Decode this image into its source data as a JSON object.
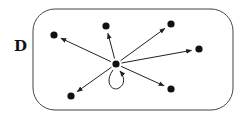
{
  "diagram": {
    "label": "D",
    "region": {
      "x": 33,
      "y": 9,
      "width": 200,
      "height": 101,
      "rx": 22,
      "stroke": "#444444"
    },
    "center_node": {
      "id": "c",
      "x": 116,
      "y": 64
    },
    "nodes": [
      {
        "id": "n1",
        "x": 54,
        "y": 35
      },
      {
        "id": "n2",
        "x": 106,
        "y": 26
      },
      {
        "id": "n3",
        "x": 171,
        "y": 24
      },
      {
        "id": "n4",
        "x": 199,
        "y": 49
      },
      {
        "id": "n5",
        "x": 171,
        "y": 89
      },
      {
        "id": "n6",
        "x": 71,
        "y": 96
      }
    ],
    "edges": [
      {
        "from": "c",
        "to": "n1"
      },
      {
        "from": "c",
        "to": "n2"
      },
      {
        "from": "c",
        "to": "n3"
      },
      {
        "from": "c",
        "to": "n4"
      },
      {
        "from": "c",
        "to": "n5"
      },
      {
        "from": "c",
        "to": "n6"
      },
      {
        "from": "c",
        "to": "c",
        "type": "self-loop"
      }
    ],
    "colors": {
      "node": "#111111",
      "edge": "#222222"
    }
  }
}
